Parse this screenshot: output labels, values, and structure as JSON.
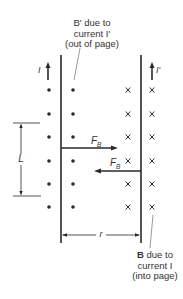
{
  "diagram": {
    "labels": {
      "b_prime_line1": "B' due to",
      "b_prime_line2": "current I'",
      "b_prime_line3": "(out of page)",
      "b_line1_bold": "B",
      "b_line1_rest": " due to",
      "b_line2": "current I",
      "b_line3": "(into page)",
      "current_left": "I",
      "current_right": "I'",
      "force_upper": "F",
      "force_upper_sub": "B",
      "force_lower": "F",
      "force_lower_sub": "B",
      "length": "L",
      "separation": "r"
    },
    "field_symbols": {
      "left_side": "dot (out of page)",
      "right_side": "cross (into page)",
      "cross_glyph": "x"
    },
    "colors": {
      "ink": "#2a2a2a",
      "background": "#ffffff"
    }
  }
}
